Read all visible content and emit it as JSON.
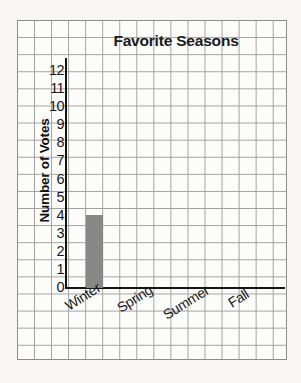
{
  "chart_data": {
    "type": "bar",
    "title": "Favorite Seasons",
    "xlabel": "",
    "ylabel": "Number of Votes",
    "categories": [
      "Winter",
      "Spring",
      "Summer",
      "Fall"
    ],
    "values": [
      4,
      0,
      0,
      0
    ],
    "ylim": [
      0,
      12
    ],
    "yticks": [
      0,
      1,
      2,
      3,
      4,
      5,
      6,
      7,
      8,
      9,
      10,
      11,
      12
    ],
    "ytick_labels": [
      "0",
      "1",
      "2",
      "3",
      "4",
      "5",
      "6",
      "7",
      "8",
      "9",
      "10",
      "11",
      "12"
    ],
    "grid": true,
    "grid_style": "graph-paper",
    "legend": false,
    "bar_color": "#878787",
    "axis_color": "#141414",
    "grid_color": "#8d8d8d",
    "background": "#fdfdfc",
    "xtick_rotation": -32
  },
  "labels": {
    "title": "Favorite Seasons",
    "y_axis_title": "Number of Votes"
  }
}
